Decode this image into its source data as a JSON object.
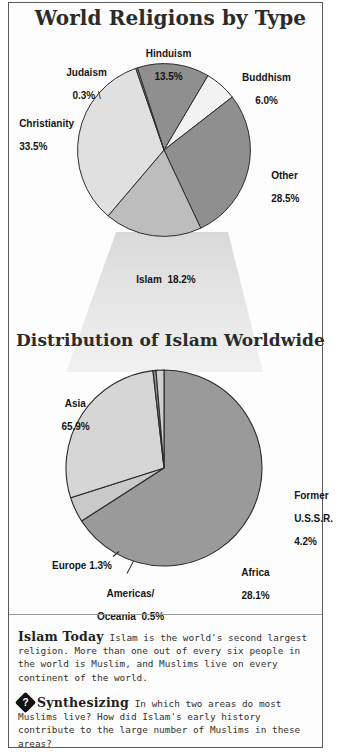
{
  "page": {
    "background": "#ffffff",
    "frame_color": "#5a5a5a"
  },
  "charts": [
    {
      "id": "world-religions",
      "title": "World Religions by Type"
    },
    {
      "id": "islam-distribution",
      "title": "Distribution of Islam Worldwide"
    }
  ],
  "labels": {
    "judaism_name": "Judaism",
    "judaism_pct": "0.3%",
    "hinduism_name": "Hinduism",
    "hinduism_pct": "13.5%",
    "buddhism_name": "Buddhism",
    "buddhism_pct": "6.0%",
    "christianity_name": "Christianity",
    "christianity_pct": "33.5%",
    "other_name": "Other",
    "other_pct": "28.5%",
    "islam_label": "Islam  18.2%",
    "asia_name": "Asia",
    "asia_pct": "65.9%",
    "former_ussr_name1": "Former",
    "former_ussr_name2": "U.S.S.R.",
    "former_ussr_pct": "4.2%",
    "africa_name": "Africa",
    "africa_pct": "28.1%",
    "europe_label": "Europe 1.3%",
    "americas_line1": "Americas/",
    "americas_line2": "Oceania  0.5%"
  },
  "notes": {
    "islam_today_heading": "Islam Today",
    "islam_today_body": "Islam is the world's second largest religion. More than one out of every six people in the world is Muslim, and Muslims live on every continent of the world.",
    "synthesizing_icon": "question-diamond-icon",
    "synthesizing_glyph": "?",
    "synthesizing_heading": "Synthesizing",
    "synthesizing_body": "In which two areas do most Muslims live? How did Islam's early history contribute to the large number of Muslims in these areas?"
  },
  "chart_data": [
    {
      "type": "pie",
      "title": "World Religions by Type",
      "categories": [
        "Hinduism",
        "Buddhism",
        "Other",
        "Islam",
        "Christianity",
        "Judaism"
      ],
      "values": [
        13.5,
        6.0,
        28.5,
        18.2,
        33.5,
        0.3
      ],
      "unit": "%",
      "colors": [
        "#8f8f8f",
        "#f2f2f2",
        "#8f8f8f",
        "#bdbdbd",
        "#e0e0e0",
        "#9b9b9b"
      ],
      "start_angle_deg": -18,
      "legend": "labels-outside",
      "xlabel": "",
      "ylabel": ""
    },
    {
      "type": "pie",
      "title": "Distribution of Islam Worldwide",
      "categories": [
        "Asia",
        "Former U.S.S.R.",
        "Africa",
        "Americas/Oceania",
        "Europe"
      ],
      "values": [
        65.9,
        4.2,
        28.1,
        0.5,
        1.3
      ],
      "unit": "%",
      "colors": [
        "#9a9a9a",
        "#c9c9c9",
        "#d6d6d6",
        "#8f8f8f",
        "#cfcfcf"
      ],
      "start_angle_deg": 0,
      "legend": "labels-outside",
      "xlabel": "",
      "ylabel": ""
    }
  ]
}
